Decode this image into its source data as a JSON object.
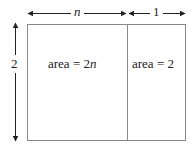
{
  "diagram": {
    "top_labels": {
      "width_left": "n",
      "width_right": "1"
    },
    "side_label": "2",
    "regions": [
      {
        "prefix": "area = 2",
        "var": "n"
      },
      {
        "prefix": "area = 2",
        "var": ""
      }
    ]
  }
}
